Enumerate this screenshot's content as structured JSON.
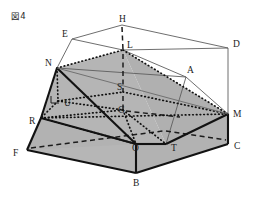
{
  "figure": {
    "caption": "図4",
    "background_color": "#ffffff",
    "face_fill_color": "#b3b3b3",
    "outline_color": "#1c1c1c",
    "thin_edge_color": "#5a5a5a"
  },
  "vertices": [
    {
      "label": "H",
      "lx": 119,
      "ly": 22,
      "px": 122,
      "py": 25
    },
    {
      "label": "E",
      "lx": 62,
      "ly": 37,
      "px": 72,
      "py": 39
    },
    {
      "label": "D",
      "lx": 233,
      "ly": 47,
      "px": 228,
      "py": 48
    },
    {
      "label": "L",
      "lx": 127,
      "ly": 48,
      "px": 123,
      "py": 50
    },
    {
      "label": "N",
      "lx": 45,
      "ly": 66,
      "px": 57,
      "py": 68
    },
    {
      "label": "A",
      "lx": 187,
      "ly": 73,
      "px": 186,
      "py": 77
    },
    {
      "label": "S",
      "lx": 117,
      "ly": 90,
      "px": 123,
      "py": 92
    },
    {
      "label": "U",
      "lx": 64,
      "ly": 106,
      "px": 58,
      "py": 101
    },
    {
      "label": "G",
      "lx": 118,
      "ly": 113,
      "px": 123,
      "py": 110
    },
    {
      "label": "M",
      "lx": 233,
      "ly": 117,
      "px": 228,
      "py": 114
    },
    {
      "label": "R",
      "lx": 29,
      "ly": 124,
      "px": 41,
      "py": 118
    },
    {
      "label": "C",
      "lx": 234,
      "ly": 149,
      "px": 228,
      "py": 144
    },
    {
      "label": "T",
      "lx": 171,
      "ly": 151,
      "px": 166,
      "py": 144
    },
    {
      "label": "O",
      "lx": 132,
      "ly": 151,
      "px": 136,
      "py": 144
    },
    {
      "label": "F",
      "lx": 13,
      "ly": 156,
      "px": 27,
      "py": 150
    },
    {
      "label": "B",
      "lx": 133,
      "ly": 186,
      "px": 136,
      "py": 173
    }
  ],
  "edges": {
    "box_thin": [
      "E-H",
      "H-D",
      "E-N",
      "D-M",
      "H-L",
      "L-A",
      "A-M",
      "E-L",
      "L-D"
    ],
    "slab_solid": [
      "N-R",
      "R-F",
      "F-B",
      "B-O",
      "O-T",
      "T-C",
      "C-M",
      "M-N"
    ],
    "pyramid_dotted": [
      "N-L",
      "L-M",
      "L-T",
      "L-R",
      "N-T",
      "R-M"
    ],
    "hidden_dashed": [
      "F-T",
      "R-G",
      "G-O",
      "H-L-axis",
      "L-S",
      "S-G"
    ],
    "solid_diagonal": [
      "N-O"
    ]
  },
  "annotations": {
    "right_angle_at": "U",
    "vertical_axis": "H-L-S-G-B"
  }
}
